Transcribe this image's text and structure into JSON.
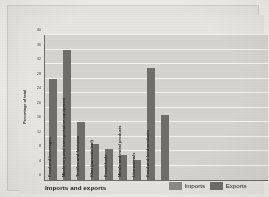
{
  "chart_data": {
    "type": "bar",
    "title": "Imports and exports",
    "xlabel": "",
    "ylabel": "Percentage of total",
    "ylim": [
      0,
      40
    ],
    "yticks": [
      0,
      4,
      8,
      12,
      16,
      20,
      24,
      28,
      32,
      36,
      40
    ],
    "grid": true,
    "legend_position": "bottom-right",
    "legend": [
      "Imports",
      "Exports"
    ],
    "categories": [
      "Food and beverages",
      "Machinery and transportation equipment",
      "Textiles and footwear",
      "Khat (narcotic leaf)",
      "Fossil fuels",
      "Metals and metal products",
      "Live animals",
      "Food and food products"
    ],
    "bars": [
      {
        "label": "Food and beverages",
        "value": 28,
        "series": "Imports"
      },
      {
        "label": "Machinery and transportation equipment",
        "value": 36,
        "series": "Imports"
      },
      {
        "label": "Textiles and footwear",
        "value": 16,
        "series": "Imports"
      },
      {
        "label": "Khat (narcotic leaf)",
        "value": 10,
        "series": "Imports"
      },
      {
        "label": "Fossil fuels",
        "value": 8.5,
        "series": "Imports"
      },
      {
        "label": "Metals and metal products",
        "value": 7,
        "series": "Exports"
      },
      {
        "label": "Live animals",
        "value": 5.5,
        "series": "Exports"
      },
      {
        "label": "Food and food products",
        "value": 31,
        "series": "Exports"
      },
      {
        "label": "",
        "value": 18,
        "series": "Exports"
      }
    ],
    "colors": {
      "bar": "#6f6e6a",
      "imports_swatch": "#8c8b87",
      "exports_swatch": "#6f6e6a",
      "plot_background": "#d5d4d0",
      "gridline": "#f4f3f1",
      "axis": "#6d6c68",
      "page_background": "#e6e5e2"
    }
  }
}
